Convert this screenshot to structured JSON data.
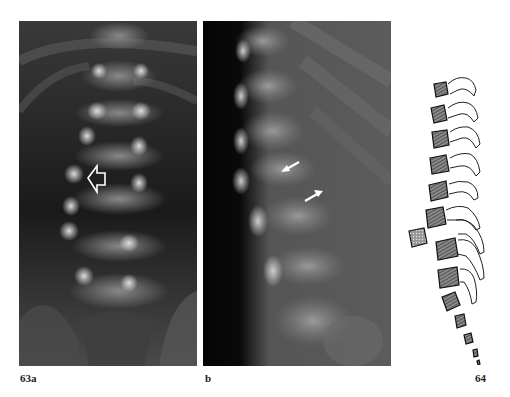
{
  "figure": {
    "panels": [
      {
        "id": "63a",
        "label": "63a",
        "kind": "radiograph-ap",
        "annotation": "hollow-arrow-left"
      },
      {
        "id": "63b",
        "label": "b",
        "kind": "radiograph-lateral",
        "annotation": "two-white-arrows"
      },
      {
        "id": "64",
        "label": "64",
        "kind": "line-drawing-lateral-spine"
      }
    ]
  }
}
